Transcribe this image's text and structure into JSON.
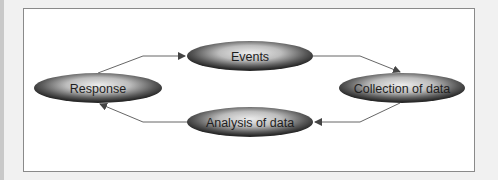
{
  "diagram": {
    "type": "cycle",
    "nodes": [
      {
        "id": "events",
        "label": "Events"
      },
      {
        "id": "collection",
        "label": "Collection of data"
      },
      {
        "id": "analysis",
        "label": "Analysis of data"
      },
      {
        "id": "response",
        "label": "Response"
      }
    ],
    "edges": [
      {
        "from": "events",
        "to": "collection"
      },
      {
        "from": "collection",
        "to": "analysis"
      },
      {
        "from": "analysis",
        "to": "response"
      },
      {
        "from": "response",
        "to": "events"
      }
    ],
    "colors": {
      "ellipse_dark": "#2e2e2e",
      "ellipse_light": "#e8e8e8",
      "frame": "#8a8a8a",
      "arrow": "#555555"
    }
  }
}
